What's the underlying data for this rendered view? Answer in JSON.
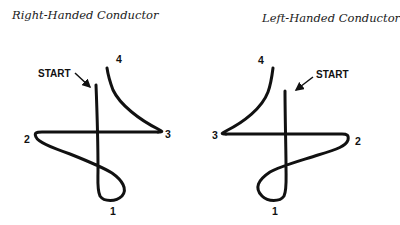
{
  "diagrams": [
    {
      "title": "Right-Handed Conductor",
      "start_label": "START",
      "beat_labels": [
        "1",
        "2",
        "3",
        "4"
      ]
    },
    {
      "title": "Left-Handed Conductor",
      "start_label": "START",
      "beat_labels": [
        "1",
        "2",
        "3",
        "4"
      ]
    }
  ],
  "colors": {
    "stroke": "#111111",
    "background": "#ffffff"
  }
}
